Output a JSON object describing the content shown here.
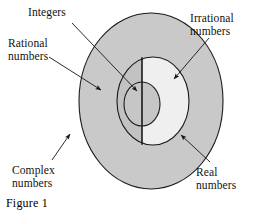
{
  "figure": {
    "caption": "Figure 1"
  },
  "colors": {
    "outer_fill": "#c9c9c9",
    "middle_left_fill": "#c2c2c2",
    "middle_right_fill": "#efefef",
    "inner_fill": "#c6c6c6",
    "stroke": "#1a1a1a",
    "background": "#ffffff",
    "text": "#111111"
  },
  "labels": {
    "integers": "Integers",
    "rational": "Rational\nnumbers",
    "irrational": "Irrational\nnumbers",
    "complex": "Complex\nnumbers",
    "real": "Real\nnumbers"
  },
  "regions": [
    {
      "name": "complex-numbers",
      "label": "Complex numbers",
      "shape": "outer-ellipse",
      "fill": "#c9c9c9"
    },
    {
      "name": "real-numbers",
      "label": "Real numbers",
      "shape": "middle-circle",
      "fill": "#c2c2c2 / #efefef"
    },
    {
      "name": "rational-numbers",
      "label": "Rational numbers",
      "shape": "middle-circle-left-half",
      "fill": "#c2c2c2"
    },
    {
      "name": "irrational-numbers",
      "label": "Irrational numbers",
      "shape": "middle-circle-right-half",
      "fill": "#efefef"
    },
    {
      "name": "integers",
      "label": "Integers",
      "shape": "inner-circle",
      "fill": "#c6c6c6"
    }
  ],
  "geometry": {
    "outer": {
      "cx": 151,
      "cy": 101,
      "rx": 72,
      "ry": 88
    },
    "middle": {
      "cx": 153,
      "cy": 101,
      "rx": 36,
      "ry": 44
    },
    "inner": {
      "cx": 142,
      "cy": 104,
      "rx": 18,
      "ry": 22
    },
    "divider_x": 142
  },
  "arrows": [
    {
      "name": "arrow-integers",
      "from": [
        72,
        22
      ],
      "to": [
        140,
        93
      ]
    },
    {
      "name": "arrow-rational",
      "from": [
        50,
        58
      ],
      "to": [
        105,
        93
      ]
    },
    {
      "name": "arrow-irrational",
      "from": [
        206,
        38
      ],
      "to": [
        172,
        80
      ]
    },
    {
      "name": "arrow-complex",
      "from": [
        52,
        160
      ],
      "to": [
        70,
        133
      ]
    },
    {
      "name": "arrow-real",
      "from": [
        208,
        162
      ],
      "to": [
        180,
        134
      ]
    }
  ]
}
